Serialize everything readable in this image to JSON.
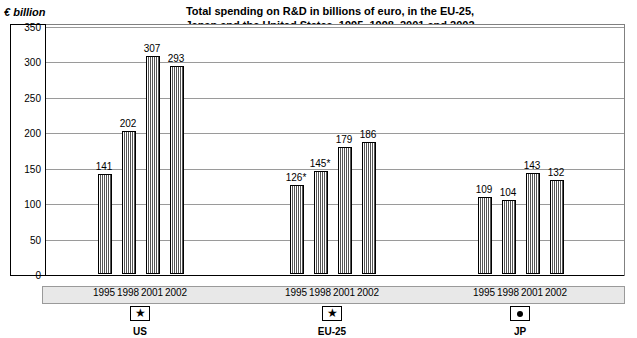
{
  "chart_data": {
    "type": "bar",
    "title": "Total spending on R&D in billions of euro, in the EU-25, Japan and the United States, 1995, 1998, 2001 and 2002",
    "title_line1": "Total spending on R&D in billions of euro, in the EU-25,",
    "title_line2": "Japan and the United States, 1995, 1998, 2001 and 2002",
    "ylabel": "€ billion",
    "xlabel": "",
    "ylim": [
      0,
      350
    ],
    "yticks": [
      "0",
      "50",
      "100",
      "150",
      "200",
      "250",
      "300",
      "350"
    ],
    "ytick_values": [
      0,
      50,
      100,
      150,
      200,
      250,
      300,
      350
    ],
    "grid": true,
    "legend": "none",
    "categories": [
      "1995",
      "1998",
      "2001",
      "2002"
    ],
    "groups": [
      {
        "name": "US",
        "flag_icon": "star-flag-icon",
        "categories": [
          "1995",
          "1998",
          "2001",
          "2002"
        ],
        "values": [
          141,
          202,
          307,
          293
        ],
        "labels": [
          "141",
          "202",
          "307",
          "293"
        ]
      },
      {
        "name": "EU-25",
        "flag_icon": "star-flag-icon",
        "categories": [
          "1995",
          "1998",
          "2001",
          "2002"
        ],
        "values": [
          126,
          145,
          179,
          186
        ],
        "labels": [
          "126*",
          "145*",
          "179",
          "186"
        ]
      },
      {
        "name": "JP",
        "flag_icon": "dot-flag-icon",
        "categories": [
          "1995",
          "1998",
          "2001",
          "2002"
        ],
        "values": [
          109,
          104,
          143,
          132
        ],
        "labels": [
          "109",
          "104",
          "143",
          "132"
        ]
      }
    ],
    "colors": {
      "bar_fill": "#ffffff",
      "bar_hatch": "#555555",
      "bar_outline": "#000000",
      "gridline": "#9a9a9a",
      "band_background": "#e8e8e8",
      "background": "#ffffff"
    }
  }
}
